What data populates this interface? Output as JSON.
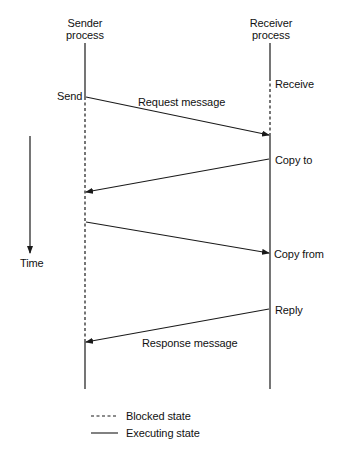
{
  "diagram": {
    "type": "sequence-diagram",
    "participants": [
      {
        "id": "sender",
        "label_line1": "Sender",
        "label_line2": "process"
      },
      {
        "id": "receiver",
        "label_line1": "Receiver",
        "label_line2": "process"
      }
    ],
    "events": {
      "send": "Send",
      "receive": "Receive",
      "copy_to": "Copy to",
      "copy_from": "Copy from",
      "reply": "Reply"
    },
    "messages": [
      {
        "from": "sender",
        "to": "receiver",
        "label": "Request message"
      },
      {
        "from": "receiver",
        "to": "sender",
        "label": ""
      },
      {
        "from": "sender",
        "to": "receiver",
        "label": ""
      },
      {
        "from": "receiver",
        "to": "sender",
        "label": "Response message"
      }
    ],
    "time_axis": {
      "label": "Time"
    },
    "legend": [
      {
        "style": "dashed",
        "label": "Blocked state"
      },
      {
        "style": "solid",
        "label": "Executing state"
      }
    ],
    "colors": {
      "line": "#1a1a1a",
      "background": "#ffffff"
    }
  }
}
